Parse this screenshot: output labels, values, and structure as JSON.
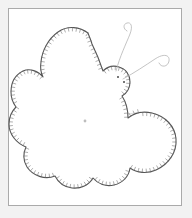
{
  "document": {
    "title": "Butterfly Applique Pattern",
    "subject": "butterfly",
    "style": "line-drawing",
    "technique": "blanket-stitch applique template",
    "background_color": "#ffffff",
    "page_tint_color": "#f2f2f2"
  },
  "frame": {
    "name": "illustration-frame",
    "x": 8,
    "y": 8,
    "width": 174,
    "height": 198,
    "border_color": "#aaaaaa",
    "border_width": 1,
    "fill_color": "#ffffff"
  },
  "figure": {
    "name": "butterfly",
    "outline_color": "#555555",
    "outline_width": 1.1,
    "stitch_color": "#6a6a6a",
    "stitch_width": 0.55,
    "seam_color": "#c9c9c9",
    "seam_width": 0.6,
    "antenna_color": "#b5b5b5",
    "antenna_width": 0.8,
    "eye_color": "#6a6a6a",
    "fill_color": "#ffffff"
  },
  "center_point": {
    "name": "seam-convergence-point",
    "x": 85,
    "y": 121,
    "marker_radius": 1.4,
    "marker_color": "#bdbdbd"
  },
  "seam_lines": [
    {
      "name": "seam-line-upper-left",
      "x2": 41,
      "y2": 56
    },
    {
      "name": "seam-line-left-upper",
      "x2": 19,
      "y2": 86
    },
    {
      "name": "seam-line-left",
      "x2": 16,
      "y2": 110
    },
    {
      "name": "seam-line-lower-left",
      "x2": 29,
      "y2": 152
    },
    {
      "name": "seam-line-lower",
      "x2": 59,
      "y2": 177
    },
    {
      "name": "seam-line-lower-right",
      "x2": 92,
      "y2": 181
    },
    {
      "name": "seam-line-right-lower",
      "x2": 125,
      "y2": 163
    },
    {
      "name": "seam-line-right",
      "x2": 141,
      "y2": 112
    },
    {
      "name": "seam-line-upper-right",
      "x2": 110,
      "y2": 74
    },
    {
      "name": "seam-line-top",
      "x2": 90,
      "y2": 38
    }
  ],
  "eyes": [
    {
      "name": "eye-left",
      "x": 118,
      "y": 77,
      "size": 1.9
    },
    {
      "name": "eye-right",
      "x": 124,
      "y": 82,
      "size": 1.9
    }
  ],
  "antennae": [
    {
      "name": "antenna-upper",
      "path": "M 116 71 C 120 56, 126 44, 130 34 C 133 26, 131 22, 127 23 C 123 24, 123 29, 127 31"
    },
    {
      "name": "antenna-lower",
      "path": "M 123 79 C 134 73, 146 65, 155 59 C 164 53, 170 55, 169 61 C 168 67, 161 68, 159 63"
    }
  ],
  "wing_outline": {
    "name": "butterfly-body-outline",
    "path": "M 88 33 C 80 27, 68 25, 58 32 C 48 39, 42 51, 41 62 C 40 68, 41 73, 43 77 C 38 71, 30 68, 23 71 C 15 75, 11 83, 11 92 C 11 98, 13 103, 16 107 C 12 111, 9 117, 9 124 C 9 134, 16 143, 26 147 C 23 153, 23 161, 27 167 C 33 176, 45 180, 55 176 C 58 182, 64 187, 72 188 C 81 189, 89 185, 93 178 C 98 184, 106 187, 114 185 C 123 183, 129 176, 130 168 C 137 173, 147 174, 156 170 C 169 164, 177 152, 176 139 C 175 126, 165 116, 152 113 C 143 111, 134 113, 128 118 C 128 110, 126 102, 122 96 C 127 93, 130 88, 130 82 C 130 75, 126 69, 119 67 C 113 65, 107 67, 103 71 C 100 62, 96 52, 92 44 C 91 40, 89 36, 88 33 Z"
  },
  "stitch_edge": {
    "name": "blanket-stitch-edging",
    "tick_length": 3.4,
    "tick_spacing_px": 4.2,
    "description": "short perpendicular ticks around the entire outline"
  }
}
